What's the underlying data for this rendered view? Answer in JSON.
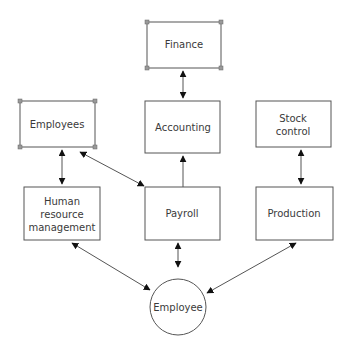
{
  "diagram": {
    "nodes": {
      "finance": {
        "label": "Finance",
        "shape": "data-store"
      },
      "employees": {
        "label": "Employees",
        "shape": "data-store"
      },
      "accounting": {
        "label": "Accounting",
        "shape": "process"
      },
      "stock_control": {
        "label_lines": [
          "Stock",
          "control"
        ],
        "shape": "process"
      },
      "hrm": {
        "label_lines": [
          "Human",
          "resource",
          "management"
        ],
        "shape": "process"
      },
      "payroll": {
        "label": "Payroll",
        "shape": "process"
      },
      "production": {
        "label": "Production",
        "shape": "process"
      },
      "employee": {
        "label": "Employee",
        "shape": "entity-circle"
      }
    },
    "edges": [
      {
        "from": "finance",
        "to": "accounting",
        "direction": "both"
      },
      {
        "from": "employees",
        "to": "hrm",
        "direction": "both"
      },
      {
        "from": "employees",
        "to": "payroll",
        "direction": "both"
      },
      {
        "from": "payroll",
        "to": "accounting",
        "direction": "forward"
      },
      {
        "from": "stock_control",
        "to": "production",
        "direction": "both"
      },
      {
        "from": "employee",
        "to": "hrm",
        "direction": "both"
      },
      {
        "from": "employee",
        "to": "payroll",
        "direction": "both"
      },
      {
        "from": "employee",
        "to": "production",
        "direction": "both"
      }
    ],
    "colors": {
      "stroke": "#555555",
      "corner_marker": "#9a9a9a",
      "text": "#3a3a3a"
    }
  }
}
